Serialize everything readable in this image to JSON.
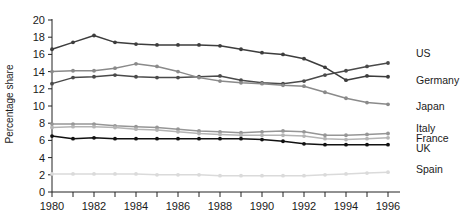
{
  "chart_data": {
    "type": "line",
    "title": "",
    "subtitle": "",
    "xlabel": "",
    "ylabel": "Percentage share",
    "xlim": [
      1980,
      1996
    ],
    "ylim": [
      0,
      20
    ],
    "grid": false,
    "legend_position": "right",
    "x": [
      1980,
      1981,
      1982,
      1983,
      1984,
      1985,
      1986,
      1987,
      1988,
      1989,
      1990,
      1991,
      1992,
      1993,
      1994,
      1995,
      1996
    ],
    "xticks": [
      1980,
      1981,
      1982,
      1983,
      1984,
      1985,
      1986,
      1987,
      1988,
      1989,
      1990,
      1991,
      1992,
      1993,
      1994,
      1995,
      1996
    ],
    "xtick_labels": [
      "1980",
      "",
      "1982",
      "",
      "1984",
      "",
      "1986",
      "",
      "1988",
      "",
      "1990",
      "",
      "1992",
      "",
      "1994",
      "",
      "1996"
    ],
    "yticks": [
      0,
      2,
      4,
      6,
      8,
      10,
      12,
      14,
      16,
      18,
      20
    ],
    "ytick_labels": [
      "0",
      "2",
      "4",
      "6",
      "8",
      "10",
      "12",
      "14",
      "16",
      "18",
      "20"
    ],
    "series": [
      {
        "name": "US",
        "color": "#3d3d3d",
        "values": [
          16.6,
          17.4,
          18.2,
          17.4,
          17.2,
          17.1,
          17.1,
          17.1,
          17.0,
          16.6,
          16.2,
          16.0,
          15.5,
          14.5,
          13.0,
          13.5,
          13.4
        ]
      },
      {
        "name": "Germany",
        "color": "#4a4a4a",
        "values": [
          12.6,
          13.3,
          13.4,
          13.6,
          13.4,
          13.3,
          13.3,
          13.4,
          13.5,
          13.0,
          12.7,
          12.6,
          12.9,
          13.6,
          14.1,
          14.6,
          15.0
        ]
      },
      {
        "name": "Japan",
        "color": "#8a8a8a",
        "values": [
          14.0,
          14.1,
          14.1,
          14.4,
          14.9,
          14.6,
          14.0,
          13.3,
          12.9,
          12.7,
          12.6,
          12.4,
          12.3,
          11.6,
          10.9,
          10.4,
          10.2
        ]
      },
      {
        "name": "Italy",
        "color": "#969696",
        "values": [
          7.9,
          7.9,
          7.9,
          7.7,
          7.6,
          7.5,
          7.3,
          7.1,
          7.0,
          6.9,
          7.0,
          7.1,
          7.0,
          6.6,
          6.6,
          6.7,
          6.8
        ]
      },
      {
        "name": "France",
        "color": "#b4b4b4",
        "values": [
          7.5,
          7.6,
          7.6,
          7.5,
          7.3,
          7.2,
          7.0,
          6.8,
          6.7,
          6.6,
          6.6,
          6.6,
          6.5,
          6.2,
          6.1,
          6.2,
          6.3
        ]
      },
      {
        "name": "UK",
        "color": "#111111",
        "values": [
          6.5,
          6.2,
          6.3,
          6.2,
          6.2,
          6.2,
          6.2,
          6.2,
          6.2,
          6.2,
          6.1,
          5.9,
          5.6,
          5.5,
          5.5,
          5.5,
          5.5
        ]
      },
      {
        "name": "Spain",
        "color": "#dadada",
        "values": [
          2.1,
          2.1,
          2.1,
          2.1,
          2.1,
          2.0,
          2.0,
          2.0,
          1.9,
          1.9,
          1.9,
          1.9,
          1.9,
          2.0,
          2.1,
          2.2,
          2.3
        ]
      }
    ],
    "legend": [
      {
        "label": "US",
        "y": 57
      },
      {
        "label": "Germany",
        "y": 84
      },
      {
        "label": "Japan",
        "y": 110
      },
      {
        "label": "Italy",
        "y": 132
      },
      {
        "label": "France",
        "y": 142
      },
      {
        "label": "UK",
        "y": 152
      },
      {
        "label": "Spain",
        "y": 173
      }
    ]
  }
}
